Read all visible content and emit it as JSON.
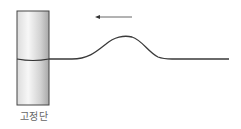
{
  "diagram": {
    "fixed_end_label": "고정단",
    "arrow_direction": "left",
    "colors": {
      "stroke": "#3a3a3a",
      "arrow": "#555555",
      "cylinder_light": "#f4f4f4",
      "cylinder_dark": "#b8b8b8",
      "label": "#666666"
    }
  }
}
